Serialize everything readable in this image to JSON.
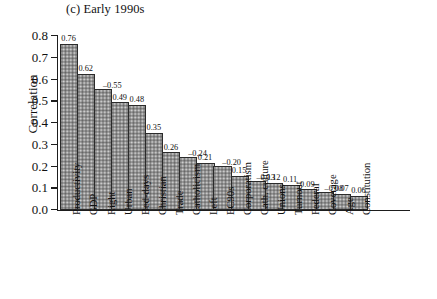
{
  "figure": {
    "title": "(c) Early 1990s"
  },
  "chart_data": {
    "type": "bar",
    "title": "(c) Early 1990s",
    "xlabel": "",
    "ylabel": "Correlation",
    "ylim": [
      0.0,
      0.8
    ],
    "ytick_labels": [
      "0.8",
      "0.7",
      "0.6",
      "0.5",
      "0.4",
      "0.3",
      "0.2",
      "0.1",
      "0.0"
    ],
    "ytick_values": [
      0.8,
      0.7,
      0.6,
      0.5,
      0.4,
      0.3,
      0.2,
      0.1,
      0.0
    ],
    "grid": false,
    "legend": "none",
    "note": "Bar heights represent the absolute value of the correlation; data labels show the signed value.",
    "categories": [
      "Productivity",
      "GDP",
      "Right",
      "Urban",
      "Bed-days",
      "Christian",
      "Trade",
      "Catholicism",
      "Left",
      "EC90s",
      "Corporatism",
      "Cath. culture",
      "Unions",
      "Turnout",
      "Federal",
      "Coverage",
      "Age",
      "Constitution"
    ],
    "values": [
      0.76,
      0.62,
      -0.55,
      0.49,
      0.48,
      0.35,
      0.26,
      -0.24,
      0.21,
      -0.2,
      0.15,
      -0.13,
      0.12,
      0.11,
      0.09,
      -0.08,
      0.07,
      0.06
    ],
    "bar_heights": [
      0.76,
      0.62,
      0.55,
      0.49,
      0.48,
      0.35,
      0.26,
      0.24,
      0.21,
      0.2,
      0.15,
      0.13,
      0.12,
      0.11,
      0.09,
      0.08,
      0.07,
      0.06
    ],
    "value_labels": [
      "0.76",
      "0.62",
      "–0.55",
      "0.49",
      "0.48",
      "0.35",
      "0.26",
      "–0.24",
      "0.21",
      "–0.20",
      "0.15",
      "–0.13",
      "0.12",
      "0.11",
      "0.09",
      "–0.08",
      "0.07",
      "0.06"
    ],
    "colors": {
      "bar_fill": "#d9d9d9",
      "bar_edge": "#2b2b2b",
      "axis": "#1d1d1d",
      "text": "#111111",
      "background": "#ffffff"
    }
  }
}
